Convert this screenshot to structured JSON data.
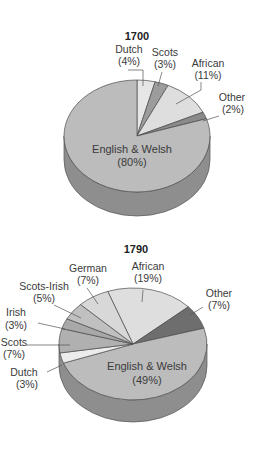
{
  "chart_data": [
    {
      "type": "pie",
      "title": "1700",
      "style": "3d",
      "categories": [
        "Dutch",
        "Scots",
        "African",
        "Other",
        "English & Welsh"
      ],
      "values": [
        4,
        3,
        11,
        2,
        80
      ],
      "labels": [
        "(4%)",
        "(3%)",
        "(11%)",
        "(2%)",
        "(80%)"
      ],
      "colors": [
        "#e6e6e6",
        "#9c9c9c",
        "#dedede",
        "#8a8a8a",
        "#bcbcbc"
      ],
      "side_color": "#8e8e8e",
      "start_angle_deg": -90
    },
    {
      "type": "pie",
      "title": "1790",
      "style": "3d",
      "categories": [
        "African",
        "Other",
        "English & Welsh",
        "Dutch",
        "Scots",
        "Irish",
        "Scots-Irish",
        "German"
      ],
      "values": [
        19,
        7,
        49,
        3,
        7,
        3,
        5,
        7
      ],
      "labels": [
        "(19%)",
        "(7%)",
        "(49%)",
        "(3%)",
        "(7%)",
        "(3%)",
        "(5%)",
        "(7%)"
      ],
      "colors": [
        "#dedede",
        "#6e6e6e",
        "#bcbcbc",
        "#ececec",
        "#b0b0b0",
        "#a8a8a8",
        "#c0c0c0",
        "#d8d8d8"
      ],
      "side_color": "#8e8e8e",
      "start_angle_deg": -110
    }
  ]
}
